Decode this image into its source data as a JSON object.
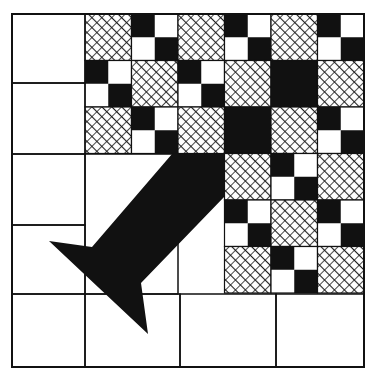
{
  "diagram": {
    "type": "quilt-block-pattern",
    "colors": {
      "background": "#ffffff",
      "ink": "#111111",
      "hatch": "#1a1a1a"
    },
    "frame": {
      "x": 12,
      "y": 14,
      "w": 352,
      "h": 353
    },
    "outline_cells": [
      {
        "name": "left-col-row-1",
        "x": 12,
        "y": 14,
        "w": 73,
        "h": 69
      },
      {
        "name": "left-col-row-2",
        "x": 12,
        "y": 83,
        "w": 73,
        "h": 71
      },
      {
        "name": "left-col-row-3",
        "x": 12,
        "y": 154,
        "w": 73,
        "h": 71
      },
      {
        "name": "left-col-row-4",
        "x": 12,
        "y": 225,
        "w": 73,
        "h": 69
      },
      {
        "name": "left-col-row-5",
        "x": 12,
        "y": 294,
        "w": 73,
        "h": 73
      },
      {
        "name": "inner-open-area",
        "x": 85,
        "y": 154,
        "w": 93,
        "h": 140
      },
      {
        "name": "bottom-row-cell-2",
        "x": 85,
        "y": 294,
        "w": 95,
        "h": 73
      },
      {
        "name": "bottom-row-cell-3",
        "x": 180,
        "y": 294,
        "w": 96,
        "h": 73
      },
      {
        "name": "bottom-row-cell-4",
        "x": 276,
        "y": 294,
        "w": 88,
        "h": 73
      }
    ],
    "patch_grid": {
      "origin_x": 85,
      "origin_y": 14,
      "cell_size": 46.5,
      "legend": {
        "H": "hatched square",
        "P": "four-patch (black/white checker)",
        "B": "solid black",
        "-": "empty"
      },
      "rows": [
        [
          "H",
          "P",
          "H",
          "P",
          "H",
          "P"
        ],
        [
          "P",
          "H",
          "P",
          "H",
          "B",
          "H"
        ],
        [
          "H",
          "P",
          "H",
          "B",
          "H",
          "P"
        ],
        [
          "-",
          "-",
          "-",
          "H",
          "P",
          "H"
        ],
        [
          "-",
          "-",
          "-",
          "P",
          "H",
          "P"
        ],
        [
          "-",
          "-",
          "-",
          "H",
          "P",
          "H"
        ]
      ]
    },
    "arrow": {
      "direction": "down-left",
      "fill": "#111111",
      "points": [
        [
          172,
          154
        ],
        [
          225,
          154
        ],
        [
          225,
          196
        ],
        [
          141,
          283
        ],
        [
          148,
          334
        ],
        [
          49,
          241
        ],
        [
          92,
          247
        ]
      ]
    }
  }
}
